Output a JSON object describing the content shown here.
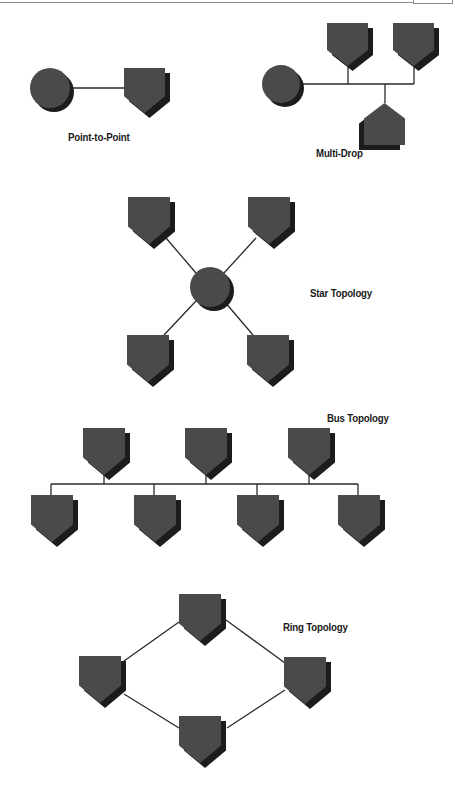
{
  "colors": {
    "node_fill": "#4a4a4a",
    "node_shadow": "#1c1c1c",
    "line": "#2a2a2a",
    "background": "#ffffff"
  },
  "diagrams": [
    {
      "id": "point-to-point",
      "label": "Point-to-Point",
      "label_pos": [
        68,
        131
      ],
      "hubs": [
        {
          "cx": 50,
          "cy": 88,
          "r": 20
        }
      ],
      "nodes": [
        {
          "x": 124,
          "y": 68,
          "w": 41,
          "h": 45,
          "dir": "down"
        }
      ],
      "lines": [
        [
          70,
          88,
          124,
          88
        ]
      ]
    },
    {
      "id": "multi-drop",
      "label": "Multi-Drop",
      "label_pos": [
        316,
        147
      ],
      "hubs": [
        {
          "cx": 281,
          "cy": 84,
          "r": 19
        }
      ],
      "nodes": [
        {
          "x": 327,
          "y": 23,
          "w": 41,
          "h": 43,
          "dir": "down"
        },
        {
          "x": 393,
          "y": 23,
          "w": 41,
          "h": 43,
          "dir": "down"
        },
        {
          "x": 364,
          "y": 103,
          "w": 41,
          "h": 42,
          "dir": "up"
        }
      ],
      "lines": [
        [
          300,
          84,
          414,
          84
        ],
        [
          348,
          66,
          348,
          84
        ],
        [
          414,
          66,
          414,
          84
        ],
        [
          385,
          84,
          385,
          103
        ]
      ]
    },
    {
      "id": "star",
      "label": "Star Topology",
      "label_pos": [
        310,
        287
      ],
      "hubs": [
        {
          "cx": 210,
          "cy": 287,
          "r": 20
        }
      ],
      "nodes": [
        {
          "x": 128,
          "y": 197,
          "w": 42,
          "h": 47,
          "dir": "down"
        },
        {
          "x": 248,
          "y": 197,
          "w": 42,
          "h": 47,
          "dir": "down"
        },
        {
          "x": 127,
          "y": 335,
          "w": 42,
          "h": 47,
          "dir": "down"
        },
        {
          "x": 247,
          "y": 335,
          "w": 42,
          "h": 47,
          "dir": "down"
        }
      ],
      "lines": [
        [
          166,
          238,
          196,
          273
        ],
        [
          256,
          238,
          224,
          273
        ],
        [
          196,
          301,
          164,
          335
        ],
        [
          224,
          301,
          253,
          335
        ]
      ]
    },
    {
      "id": "bus",
      "label": "Bus Topology",
      "label_pos": [
        327,
        412
      ],
      "hubs": [],
      "nodes": [
        {
          "x": 83,
          "y": 428,
          "w": 42,
          "h": 47,
          "dir": "down"
        },
        {
          "x": 185,
          "y": 428,
          "w": 42,
          "h": 47,
          "dir": "down"
        },
        {
          "x": 288,
          "y": 428,
          "w": 42,
          "h": 47,
          "dir": "down"
        },
        {
          "x": 31,
          "y": 495,
          "w": 42,
          "h": 47,
          "dir": "down"
        },
        {
          "x": 134,
          "y": 495,
          "w": 42,
          "h": 47,
          "dir": "down"
        },
        {
          "x": 237,
          "y": 495,
          "w": 42,
          "h": 47,
          "dir": "down"
        },
        {
          "x": 338,
          "y": 495,
          "w": 42,
          "h": 47,
          "dir": "down"
        }
      ],
      "lines": [
        [
          51,
          484,
          358,
          484
        ],
        [
          104,
          475,
          104,
          484
        ],
        [
          206,
          475,
          206,
          484
        ],
        [
          309,
          475,
          309,
          484
        ],
        [
          51,
          484,
          51,
          495
        ],
        [
          154,
          484,
          154,
          495
        ],
        [
          257,
          484,
          257,
          495
        ],
        [
          358,
          484,
          358,
          495
        ]
      ]
    },
    {
      "id": "ring",
      "label": "Ring Topology",
      "label_pos": [
        283,
        621
      ],
      "hubs": [],
      "nodes": [
        {
          "x": 179,
          "y": 594,
          "w": 42,
          "h": 47,
          "dir": "down"
        },
        {
          "x": 79,
          "y": 656,
          "w": 42,
          "h": 47,
          "dir": "down"
        },
        {
          "x": 284,
          "y": 657,
          "w": 42,
          "h": 47,
          "dir": "down"
        },
        {
          "x": 179,
          "y": 716,
          "w": 42,
          "h": 47,
          "dir": "down"
        }
      ],
      "lines": [
        [
          179,
          622,
          124,
          661
        ],
        [
          226,
          620,
          285,
          663
        ],
        [
          124,
          694,
          179,
          728
        ],
        [
          227,
          728,
          285,
          690
        ]
      ]
    }
  ]
}
